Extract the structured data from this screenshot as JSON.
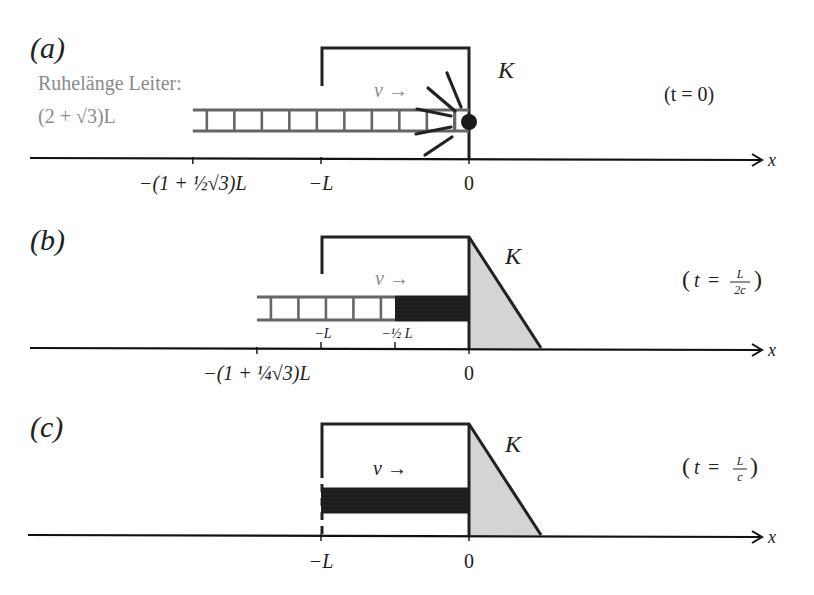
{
  "figure": {
    "panels": [
      {
        "id": "a",
        "label": "(a)",
        "time_label": "(t = 0)",
        "velocity_label": "v →",
        "frame_label": "K",
        "axis_label": "x",
        "rest_length_caption": "Ruhelänge Leiter:",
        "rest_length_value": "(2 + √3)L",
        "ticks": [
          {
            "value_L": -1.866,
            "label": "−(1 + ½√3)L"
          },
          {
            "value_L": -1.0,
            "label": "−L"
          },
          {
            "value_L": 0.0,
            "label": "0"
          }
        ],
        "ladder_from_L": -1.866,
        "ladder_to_L": 0.0,
        "compressed_from_L": null,
        "state": "collision"
      },
      {
        "id": "b",
        "label": "(b)",
        "time_label": "(t = L/2c)",
        "time_num": "L",
        "time_den": "2c",
        "velocity_label": "v →",
        "frame_label": "K",
        "axis_label": "x",
        "ticks": [
          {
            "value_L": -1.433,
            "label": "−(1 + ¼√3)L"
          },
          {
            "value_L": 0.0,
            "label": "0"
          }
        ],
        "inner_ticks": [
          {
            "value_L": -1.0,
            "label": "−L"
          },
          {
            "value_L": -0.5,
            "label": "−½ L"
          }
        ],
        "ladder_from_L": -1.433,
        "ladder_to_L": 0.0,
        "compressed_from_L": -0.5,
        "state": "partially-stopped"
      },
      {
        "id": "c",
        "label": "(c)",
        "time_label": "(t = L/c)",
        "time_num": "L",
        "time_den": "c",
        "velocity_label": "v →",
        "frame_label": "K",
        "axis_label": "x",
        "ticks": [
          {
            "value_L": -1.0,
            "label": "−L"
          },
          {
            "value_L": 0.0,
            "label": "0"
          }
        ],
        "ladder_from_L": -1.0,
        "ladder_to_L": 0.0,
        "compressed_from_L": -1.0,
        "state": "fully-stopped"
      }
    ],
    "colors": {
      "ladder": "#666666",
      "compressed": "#1a1a1a",
      "wedge": "#d4d4d4",
      "frame": "#222222",
      "caption": "#8a8a8a"
    }
  }
}
